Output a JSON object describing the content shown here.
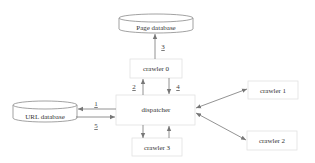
{
  "diagram": {
    "nodes": {
      "page_db": "Page database",
      "url_db": "URL database",
      "dispatcher": "dispatcher",
      "crawler0": "crawler 0",
      "crawler1": "crawler 1",
      "crawler2": "crawler 2",
      "crawler3": "crawler 3"
    },
    "edge_labels": {
      "e1": "1",
      "e2": "2",
      "e3": "3",
      "e4": "4",
      "e5": "5"
    },
    "edges": [
      {
        "from": "dispatcher",
        "to": "url_db",
        "label": "1"
      },
      {
        "from": "dispatcher",
        "to": "crawler0",
        "label": "2"
      },
      {
        "from": "crawler0",
        "to": "page_db",
        "label": "3"
      },
      {
        "from": "crawler0",
        "to": "dispatcher",
        "label": "4"
      },
      {
        "from": "url_db",
        "to": "dispatcher",
        "label": "5"
      },
      {
        "from": "dispatcher",
        "to": "crawler1",
        "bidirectional": true
      },
      {
        "from": "dispatcher",
        "to": "crawler2",
        "bidirectional": true
      },
      {
        "from": "dispatcher",
        "to": "crawler3"
      },
      {
        "from": "crawler3",
        "to": "dispatcher"
      }
    ]
  }
}
